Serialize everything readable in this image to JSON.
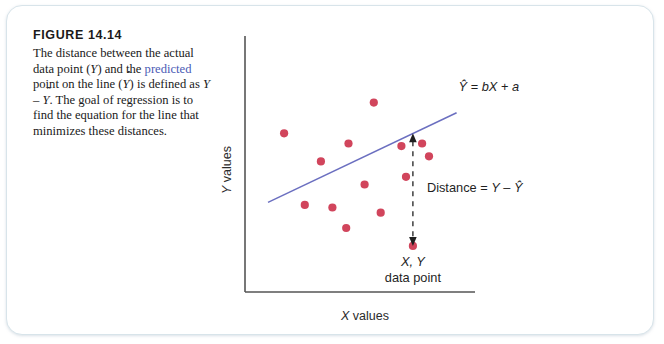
{
  "figure": {
    "title": "FIGURE 14.14",
    "caption_segments": [
      {
        "text": "The distance between the actual data point (",
        "style": "plain"
      },
      {
        "text": "Y",
        "style": "italic"
      },
      {
        "text": ") and the ",
        "style": "plain"
      },
      {
        "text": "predicted",
        "style": "highlight"
      },
      {
        "text": " point on the line (",
        "style": "plain"
      },
      {
        "text": "Ŷ",
        "style": "italic"
      },
      {
        "text": ") is defined as ",
        "style": "plain"
      },
      {
        "text": "Y",
        "style": "italic"
      },
      {
        "text": " – ",
        "style": "plain"
      },
      {
        "text": "Ŷ",
        "style": "italic"
      },
      {
        "text": ". The goal of regression is to find the equation for the line that minimizes these distances.",
        "style": "plain"
      }
    ],
    "caption_plain": "The distance between the actual data point (Y) and the predicted point on the line (Ŷ) is defined as Y – Ŷ. The goal of regression is to find the equation for the line that minimizes these distances."
  },
  "colors": {
    "point": "#d1455c",
    "regression_line": "#6b6fc0",
    "axis": "#555555",
    "annotation": "#1f1f1f",
    "highlight": "#4b5bb5",
    "card_border": "#d8e4ea"
  },
  "annotations": {
    "equation": "Ŷ = bX + a",
    "distance": "Distance = Y – Ŷ",
    "data_point_line1": "X, Y",
    "data_point_line2": "data point"
  },
  "chart_data": {
    "type": "scatter",
    "title": "FIGURE 14.14",
    "xlabel": "X values",
    "ylabel": "Y values",
    "xlim": [
      0,
      100
    ],
    "ylim": [
      0,
      100
    ],
    "grid": false,
    "legend": "none",
    "axis_ticks": "none",
    "points": [
      {
        "x": 17,
        "y": 62
      },
      {
        "x": 33,
        "y": 51
      },
      {
        "x": 45,
        "y": 58
      },
      {
        "x": 56,
        "y": 74
      },
      {
        "x": 68,
        "y": 57
      },
      {
        "x": 80,
        "y": 53
      },
      {
        "x": 70,
        "y": 45
      },
      {
        "x": 77,
        "y": 58
      },
      {
        "x": 52,
        "y": 42
      },
      {
        "x": 59,
        "y": 31
      },
      {
        "x": 38,
        "y": 33
      },
      {
        "x": 26,
        "y": 34
      },
      {
        "x": 44,
        "y": 25
      },
      {
        "x": 73,
        "y": 18
      }
    ],
    "regression_line": {
      "label": "Ŷ = bX + a",
      "x_start": 10,
      "y_start": 35,
      "x_end": 92,
      "y_end": 70
    },
    "residual_annotation": {
      "label": "Distance = Y – Ŷ",
      "x": 73,
      "y_predicted": 62,
      "y_actual": 18
    }
  }
}
